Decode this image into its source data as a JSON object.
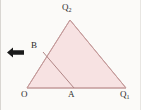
{
  "figure": {
    "kind": "geometry-diagram",
    "width": 141,
    "height": 110,
    "background_color": "#fbfaf8",
    "fill_color": "#f7e2e2",
    "stroke_color": "#b98f8f",
    "label_color": "#2b2b2b",
    "arrow_color": "#1a1a1a",
    "border_color": "#d9d6d2"
  },
  "labels": {
    "origin": "O",
    "point_a": "A",
    "point_b": "B",
    "vertex_q1_base": "Q",
    "vertex_q1_sub": "1",
    "vertex_q2_base": "Q",
    "vertex_q2_sub": "2"
  },
  "geometry": {
    "points": {
      "O": {
        "x": 27,
        "y": 88
      },
      "A": {
        "x": 74,
        "y": 88
      },
      "Q1": {
        "x": 126,
        "y": 88
      },
      "Q2": {
        "x": 70,
        "y": 20
      },
      "B": {
        "x": 43,
        "y": 52
      }
    },
    "triangle_path": "M27,88 L126,88 L70,20 Z",
    "cevian_path": "M43,52 L74,88",
    "segments": [
      {
        "name": "base-O-Q1",
        "from": "O",
        "to": "Q1"
      },
      {
        "name": "side-O-Q2",
        "from": "O",
        "to": "Q2"
      },
      {
        "name": "side-Q2-Q1",
        "from": "Q2",
        "to": "Q1"
      },
      {
        "name": "cevian-B-A",
        "from": "B",
        "to": "A"
      }
    ]
  },
  "annotations": {
    "arrow_icon": "left-arrow-icon",
    "arrow_direction": "left"
  }
}
